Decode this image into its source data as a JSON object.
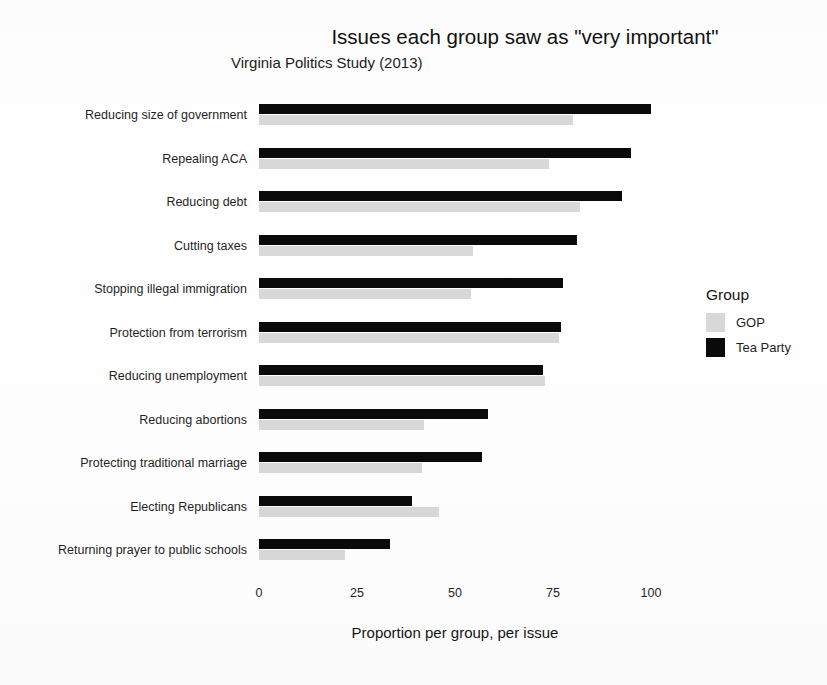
{
  "chart_data": {
    "type": "bar",
    "orientation": "horizontal",
    "title": "Issues each group saw as \"very important\"",
    "subtitle": "Virginia Politics Study (2013)",
    "xlabel": "Proportion per group, per issue",
    "ylabel": "",
    "xlim": [
      0,
      100
    ],
    "xticks": [
      0,
      25,
      50,
      75,
      100
    ],
    "xticklabels": [
      "0",
      "25",
      "50",
      "75",
      "100"
    ],
    "grid": false,
    "legend": {
      "title": "Group",
      "position": "right",
      "entries": [
        {
          "name": "GOP",
          "color": "#d9d9d9"
        },
        {
          "name": "Tea Party",
          "color": "#0a0a0a"
        }
      ]
    },
    "categories": [
      "Reducing size of government",
      "Repealing ACA",
      "Reducing debt",
      "Cutting taxes",
      "Stopping illegal immigration",
      "Protection from terrorism",
      "Reducing unemployment",
      "Reducing abortions",
      "Protecting traditional marriage",
      "Electing Republicans",
      "Returning prayer to public schools"
    ],
    "series": [
      {
        "name": "Tea Party",
        "color": "#0a0a0a",
        "values": [
          100,
          95,
          92.5,
          81,
          77.5,
          77,
          72.5,
          58.5,
          57,
          39,
          33.5
        ]
      },
      {
        "name": "GOP",
        "color": "#d9d9d9",
        "values": [
          80,
          74,
          82,
          54.5,
          54,
          76.5,
          73,
          42,
          41.5,
          46,
          22
        ]
      }
    ]
  }
}
